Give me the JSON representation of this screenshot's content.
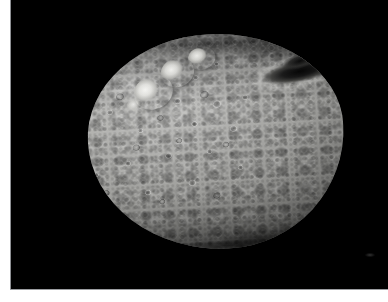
{
  "page": {
    "background_color": "#ffffff",
    "rule_color": "#8e9094",
    "width": 388,
    "height": 302
  },
  "photo": {
    "kind": "astronomical-photograph",
    "subject": "asteroid-vesta",
    "caption": "",
    "sky_color": "#000000",
    "body_color_light": "#e8e8e5",
    "body_color_mid": "#9a9a97",
    "body_color_dark": "#5a5a57",
    "plate": {
      "x": 11,
      "y": 0,
      "width": 377,
      "height": 289
    },
    "body": {
      "x": 88,
      "y": 34,
      "width": 256,
      "height": 215,
      "rotation_deg": -3
    },
    "features": [
      {
        "name": "snowman-crater-large",
        "x": 48,
        "y": 38,
        "w": 40,
        "h": 34,
        "tone": "bright"
      },
      {
        "name": "snowman-crater-middle",
        "x": 76,
        "y": 22,
        "w": 34,
        "h": 29,
        "tone": "bright"
      },
      {
        "name": "snowman-crater-small",
        "x": 104,
        "y": 12,
        "w": 28,
        "h": 23,
        "tone": "bright"
      },
      {
        "name": "bright-ejecta-spur",
        "x": 40,
        "y": 58,
        "w": 22,
        "h": 18,
        "tone": "bright"
      },
      {
        "name": "dark-shadowed-basin",
        "x": 168,
        "y": 32,
        "w": 86,
        "h": 24,
        "tone": "dark"
      },
      {
        "name": "dark-shadowed-basin-inner",
        "x": 196,
        "y": 24,
        "w": 40,
        "h": 15,
        "tone": "dark"
      },
      {
        "name": "rough-northern-limb",
        "tone": "mixed"
      },
      {
        "name": "rough-southern-rim",
        "tone": "mixed"
      }
    ],
    "medium_craters": [
      {
        "x": 150,
        "y": 82,
        "w": 13,
        "h": 12
      },
      {
        "x": 176,
        "y": 96,
        "w": 11,
        "h": 10
      },
      {
        "x": 196,
        "y": 74,
        "w": 9,
        "h": 8
      },
      {
        "x": 214,
        "y": 100,
        "w": 14,
        "h": 13
      },
      {
        "x": 192,
        "y": 120,
        "w": 10,
        "h": 9
      },
      {
        "x": 138,
        "y": 124,
        "w": 9,
        "h": 8
      },
      {
        "x": 108,
        "y": 104,
        "w": 10,
        "h": 9
      },
      {
        "x": 84,
        "y": 128,
        "w": 8,
        "h": 8
      },
      {
        "x": 230,
        "y": 126,
        "w": 12,
        "h": 11
      },
      {
        "x": 206,
        "y": 148,
        "w": 9,
        "h": 9
      },
      {
        "x": 164,
        "y": 150,
        "w": 11,
        "h": 10
      },
      {
        "x": 124,
        "y": 156,
        "w": 9,
        "h": 9
      },
      {
        "x": 92,
        "y": 166,
        "w": 8,
        "h": 8
      },
      {
        "x": 244,
        "y": 96,
        "w": 10,
        "h": 9
      },
      {
        "x": 218,
        "y": 62,
        "w": 8,
        "h": 7
      },
      {
        "x": 142,
        "y": 186,
        "w": 10,
        "h": 9
      },
      {
        "x": 186,
        "y": 178,
        "w": 12,
        "h": 11
      },
      {
        "x": 60,
        "y": 106,
        "w": 9,
        "h": 9
      },
      {
        "x": 68,
        "y": 146,
        "w": 7,
        "h": 7
      },
      {
        "x": 236,
        "y": 166,
        "w": 9,
        "h": 8
      }
    ],
    "light_rim_craters": [
      {
        "x": 118,
        "y": 88,
        "w": 12,
        "h": 11
      },
      {
        "x": 158,
        "y": 112,
        "w": 10,
        "h": 9
      },
      {
        "x": 202,
        "y": 90,
        "w": 13,
        "h": 12
      },
      {
        "x": 132,
        "y": 140,
        "w": 11,
        "h": 10
      },
      {
        "x": 176,
        "y": 136,
        "w": 9,
        "h": 8
      },
      {
        "x": 222,
        "y": 142,
        "w": 10,
        "h": 9
      },
      {
        "x": 100,
        "y": 184,
        "w": 10,
        "h": 9
      },
      {
        "x": 156,
        "y": 196,
        "w": 9,
        "h": 8
      },
      {
        "x": 210,
        "y": 192,
        "w": 11,
        "h": 10
      },
      {
        "x": 78,
        "y": 92,
        "w": 10,
        "h": 10
      }
    ]
  }
}
